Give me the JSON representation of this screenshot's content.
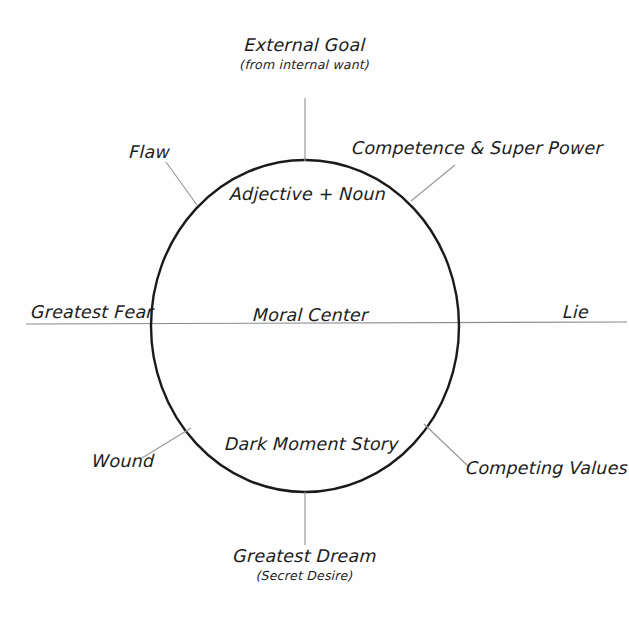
{
  "diagram": {
    "type": "radial-label-diagram",
    "ink_color": "#1c1c1c",
    "connector_color": "#9a9a9a",
    "background_color": "#fefefe",
    "circle": {
      "center_x": 305,
      "center_y": 326,
      "radius_x": 154,
      "radius_y": 166,
      "stroke_color": "#1a1a1a",
      "stroke_width": 2.4
    },
    "axis_line": {
      "y": 323,
      "x_start": 0,
      "x_end": 627,
      "stroke_color": "#8c8c8c"
    },
    "inner_labels": [
      {
        "name": "adjective-noun",
        "text": "Adjective + Noun",
        "x": 305,
        "y": 196
      },
      {
        "name": "moral-center",
        "text": "Moral Center",
        "x": 305,
        "y": 317
      },
      {
        "name": "dark-moment-story",
        "text": "Dark Moment Story",
        "x": 305,
        "y": 447
      }
    ],
    "outer_labels": [
      {
        "name": "external-goal",
        "main": "External Goal",
        "sub": "(from internal want)",
        "position": "top"
      },
      {
        "name": "competence-super-power",
        "main": "Competence & Super Power",
        "sub": "",
        "position": "upper-right"
      },
      {
        "name": "flaw",
        "main": "Flaw",
        "sub": "",
        "position": "upper-left"
      },
      {
        "name": "greatest-fear",
        "main": "Greatest Fear",
        "sub": "",
        "position": "left"
      },
      {
        "name": "lie",
        "main": "Lie",
        "sub": "",
        "position": "right"
      },
      {
        "name": "wound",
        "main": "Wound",
        "sub": "",
        "position": "lower-left"
      },
      {
        "name": "competing-values",
        "main": "Competing Values",
        "sub": "",
        "position": "lower-right"
      },
      {
        "name": "greatest-dream",
        "main": "Greatest Dream",
        "sub": "(Secret Desire)",
        "position": "bottom"
      }
    ]
  }
}
